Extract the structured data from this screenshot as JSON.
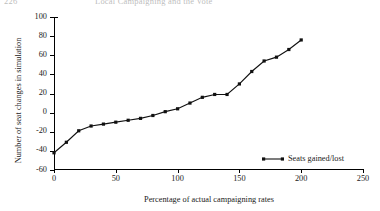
{
  "running_head": {
    "folio": "226",
    "title": "Local Campaigning and the Vote"
  },
  "chart_data": {
    "type": "line",
    "title": "",
    "xlabel": "Percentage of actual campaigning rates",
    "ylabel": "Number of seat changes in simulation",
    "xlim": [
      0,
      250
    ],
    "ylim": [
      -60,
      100
    ],
    "xticks": [
      0,
      50,
      100,
      150,
      200,
      250
    ],
    "yticks": [
      -60,
      -40,
      -20,
      0,
      20,
      40,
      60,
      80,
      100
    ],
    "xtick_labels": [
      "0",
      "50",
      "100",
      "150",
      "200",
      "250"
    ],
    "ytick_labels": [
      "-60",
      "-40",
      "-20",
      "0",
      "20",
      "40",
      "60",
      "80",
      "100"
    ],
    "grid": false,
    "legend_position": "lower right",
    "series": [
      {
        "name": "Seats gained/lost",
        "marker": "square",
        "color": "#111111",
        "x": [
          0,
          10,
          20,
          30,
          40,
          50,
          60,
          70,
          80,
          90,
          100,
          110,
          120,
          130,
          140,
          150,
          160,
          170,
          180,
          190,
          200
        ],
        "y": [
          -42,
          -31,
          -19,
          -14,
          -12,
          -10,
          -8,
          -6,
          -3,
          1,
          4,
          10,
          16,
          19,
          19,
          30,
          43,
          54,
          58,
          66,
          76
        ]
      }
    ],
    "legend": [
      {
        "label": "Seats gained/lost",
        "marker": "square",
        "color": "#111111"
      }
    ]
  }
}
